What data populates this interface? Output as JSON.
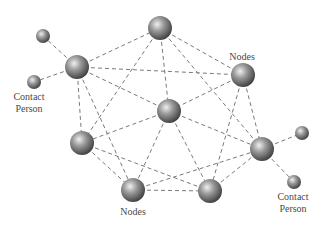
{
  "diagram": {
    "type": "network",
    "labels": {
      "nodes_top": "Nodes",
      "nodes_bottom": "Nodes",
      "contact_left_line1": "Contact",
      "contact_left_line2": "Person",
      "contact_right_line1": "Contact",
      "contact_right_line2": "Person"
    },
    "nodes": [
      {
        "id": "T",
        "kind": "node",
        "x": 160,
        "y": 28,
        "r": 12
      },
      {
        "id": "UL",
        "kind": "node",
        "x": 77,
        "y": 67,
        "r": 12
      },
      {
        "id": "UR",
        "kind": "node",
        "x": 243,
        "y": 75,
        "r": 12
      },
      {
        "id": "C",
        "kind": "node",
        "x": 169,
        "y": 111,
        "r": 12
      },
      {
        "id": "L",
        "kind": "node",
        "x": 82,
        "y": 143,
        "r": 12
      },
      {
        "id": "R",
        "kind": "node",
        "x": 262,
        "y": 149,
        "r": 12
      },
      {
        "id": "BL",
        "kind": "node",
        "x": 133,
        "y": 190,
        "r": 12
      },
      {
        "id": "BR",
        "kind": "node",
        "x": 210,
        "y": 191,
        "r": 12
      },
      {
        "id": "CP1",
        "kind": "contact",
        "x": 43,
        "y": 36,
        "r": 7
      },
      {
        "id": "CP2",
        "kind": "contact",
        "x": 34,
        "y": 82,
        "r": 7
      },
      {
        "id": "CP3",
        "kind": "contact",
        "x": 302,
        "y": 133,
        "r": 7
      },
      {
        "id": "CP4",
        "kind": "contact",
        "x": 294,
        "y": 182,
        "r": 7
      }
    ],
    "edges": [
      [
        "UL",
        "CP1"
      ],
      [
        "UL",
        "CP2"
      ],
      [
        "R",
        "CP3"
      ],
      [
        "R",
        "CP4"
      ],
      [
        "UL",
        "T"
      ],
      [
        "UL",
        "UR"
      ],
      [
        "UL",
        "C"
      ],
      [
        "UL",
        "L"
      ],
      [
        "UL",
        "BL"
      ],
      [
        "T",
        "UR"
      ],
      [
        "T",
        "C"
      ],
      [
        "T",
        "L"
      ],
      [
        "T",
        "R"
      ],
      [
        "UR",
        "C"
      ],
      [
        "UR",
        "BR"
      ],
      [
        "UR",
        "R"
      ],
      [
        "C",
        "L"
      ],
      [
        "C",
        "BL"
      ],
      [
        "C",
        "BR"
      ],
      [
        "C",
        "R"
      ],
      [
        "L",
        "BL"
      ],
      [
        "L",
        "BR"
      ],
      [
        "BL",
        "BR"
      ],
      [
        "BL",
        "R"
      ],
      [
        "BR",
        "R"
      ]
    ],
    "colors": {
      "sphere_light": "#e6e6e6",
      "sphere_mid": "#8c8c8c",
      "sphere_dark": "#3c3c3c",
      "edge": "#7a7a7a",
      "label": "#4a4a4a"
    }
  }
}
